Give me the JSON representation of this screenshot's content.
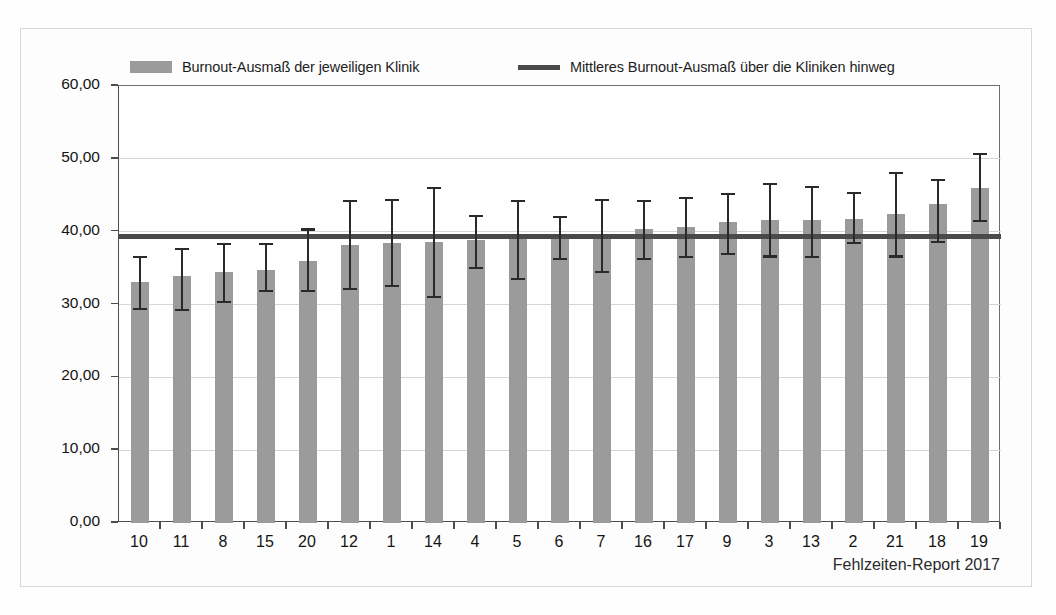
{
  "legend": {
    "bar_label": "Burnout-Ausmaß der jeweiligen Klinik",
    "line_label": "Mittleres Burnout-Ausmaß über die Kliniken hinweg",
    "bar_color": "#9b9b9b",
    "line_color": "#4a4a4a"
  },
  "footer": {
    "source": "Fehlzeiten-Report 2017"
  },
  "axis": {
    "y_ticks": [
      "0,00",
      "10,00",
      "20,00",
      "30,00",
      "40,00",
      "50,00",
      "60,00"
    ]
  },
  "chart_data": {
    "type": "bar",
    "title": "",
    "subtitle": "",
    "xlabel": "",
    "ylabel": "",
    "ylim": [
      0,
      60
    ],
    "ytick_values": [
      0,
      10,
      20,
      30,
      40,
      50,
      60
    ],
    "ytick_labels": [
      "0,00",
      "10,00",
      "20,00",
      "30,00",
      "40,00",
      "50,00",
      "60,00"
    ],
    "grid": true,
    "legend_position": "top",
    "categories": [
      "10",
      "11",
      "8",
      "15",
      "20",
      "12",
      "1",
      "14",
      "4",
      "5",
      "6",
      "7",
      "16",
      "17",
      "9",
      "3",
      "13",
      "2",
      "21",
      "18",
      "19"
    ],
    "series": [
      {
        "name": "Burnout-Ausmaß der jeweiligen Klinik",
        "type": "bar",
        "color": "#9b9b9b",
        "values": [
          33.1,
          33.9,
          34.5,
          34.7,
          36.0,
          38.2,
          38.5,
          38.6,
          38.8,
          39.1,
          39.3,
          39.6,
          40.4,
          40.7,
          41.3,
          41.6,
          41.6,
          41.8,
          42.4,
          43.8,
          46.0
        ]
      }
    ],
    "error_bars": {
      "lower": [
        29.4,
        29.3,
        30.4,
        31.8,
        31.9,
        32.1,
        32.5,
        31.0,
        35.0,
        33.5,
        36.2,
        34.5,
        36.3,
        36.5,
        37.0,
        36.6,
        36.5,
        38.4,
        36.6,
        38.6,
        41.5
      ],
      "upper": [
        36.5,
        37.6,
        38.3,
        38.3,
        40.3,
        44.2,
        44.3,
        46.0,
        42.2,
        44.2,
        42.0,
        44.3,
        44.2,
        44.6,
        45.2,
        46.6,
        46.2,
        45.3,
        48.1,
        47.1,
        50.7
      ]
    },
    "reference_line": {
      "name": "Mittleres Burnout-Ausmaß über die Kliniken hinweg",
      "value": 39.3,
      "color": "#4a4a4a"
    }
  }
}
